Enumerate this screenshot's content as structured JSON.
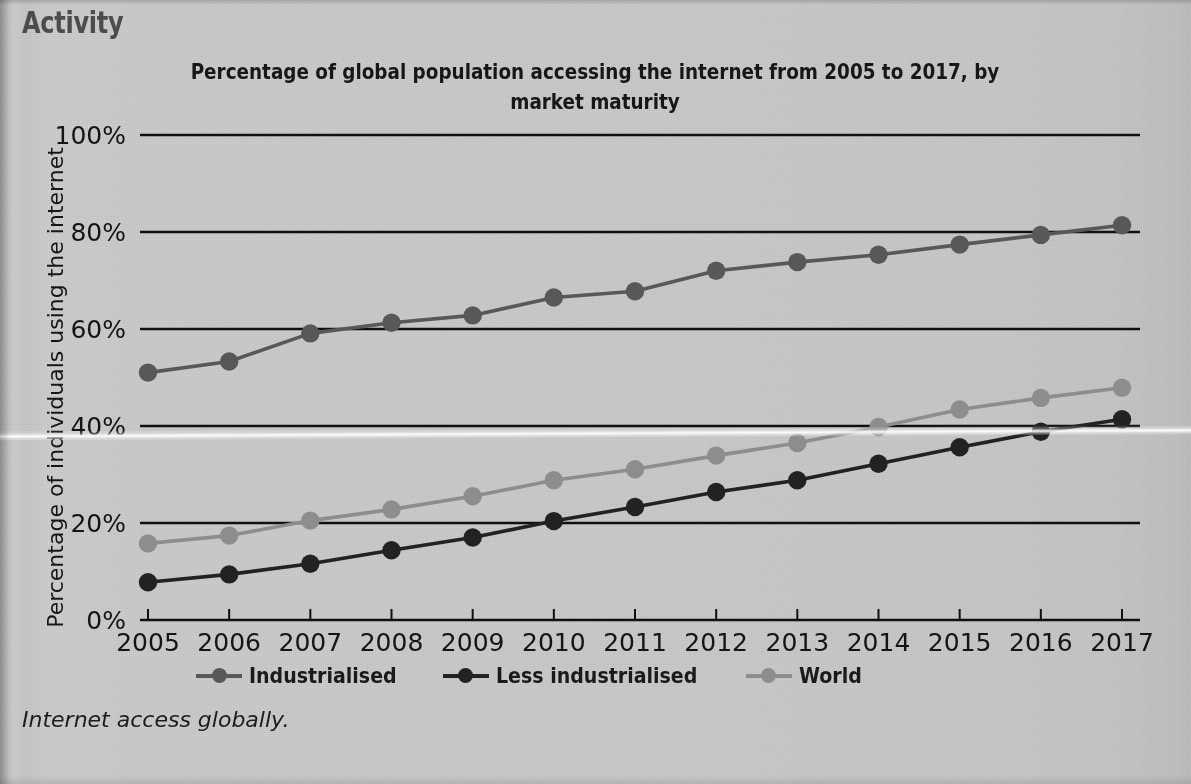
{
  "header": {
    "activity_label": "Activity"
  },
  "caption": {
    "text": "Internet access globally."
  },
  "chart_data": {
    "type": "line",
    "title": "Percentage of global population accessing the internet from 2005 to 2017, by market maturity",
    "xlabel": "",
    "ylabel": "Percentage of individuals using the internet",
    "categories": [
      "2005",
      "2006",
      "2007",
      "2008",
      "2009",
      "2010",
      "2011",
      "2012",
      "2013",
      "2014",
      "2015",
      "2016",
      "2017"
    ],
    "x": [
      2005,
      2006,
      2007,
      2008,
      2009,
      2010,
      2011,
      2012,
      2013,
      2014,
      2015,
      2016,
      2017
    ],
    "xlim": [
      2005,
      2017
    ],
    "ylim": [
      0,
      100
    ],
    "yticks": [
      0,
      20,
      40,
      60,
      80,
      100
    ],
    "ytick_labels": [
      "0%",
      "20%",
      "40%",
      "60%",
      "80%",
      "100%"
    ],
    "grid": "horizontal",
    "legend_position": "bottom",
    "marker": "circle",
    "series": [
      {
        "name": "Industrialised",
        "color": "#585858",
        "values": [
          51.0,
          53.3,
          59.1,
          61.3,
          62.8,
          66.5,
          67.8,
          72.0,
          73.8,
          75.3,
          77.4,
          79.4,
          81.4
        ]
      },
      {
        "name": "Less industrialised",
        "color": "#222222",
        "values": [
          7.8,
          9.4,
          11.6,
          14.4,
          17.0,
          20.4,
          23.3,
          26.4,
          28.8,
          32.2,
          35.6,
          38.8,
          41.4
        ]
      },
      {
        "name": "World",
        "color": "#8d8d8d",
        "values": [
          15.8,
          17.4,
          20.5,
          22.8,
          25.5,
          28.8,
          31.1,
          33.9,
          36.5,
          39.8,
          43.4,
          45.8,
          47.9
        ]
      }
    ]
  },
  "legend": {
    "entries": [
      {
        "label": "Industrialised",
        "color": "#585858"
      },
      {
        "label": "Less industrialised",
        "color": "#222222"
      },
      {
        "label": "World",
        "color": "#8d8d8d"
      }
    ]
  }
}
